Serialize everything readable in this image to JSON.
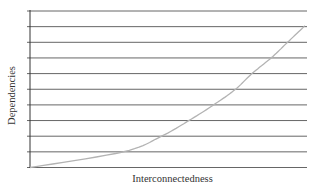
{
  "chart_data": {
    "type": "line",
    "title": "",
    "xlabel": "Interconnectedness",
    "ylabel": "Dependencies",
    "grid": true,
    "gridlines_count": 11,
    "legend": null,
    "x_ticks": [],
    "y_ticks": [],
    "xlim": [
      0,
      1
    ],
    "ylim": [
      0,
      10
    ],
    "series": [
      {
        "name": "Dependencies vs Interconnectedness",
        "color": "#b3b3b3",
        "x": [
          0.0,
          0.34,
          0.48,
          0.58,
          0.67,
          0.75,
          0.81,
          0.88,
          0.94,
          1.0
        ],
        "y": [
          0,
          1,
          2,
          3,
          4,
          5,
          6,
          7,
          8,
          9
        ]
      }
    ]
  },
  "axes": {
    "x_label": "Interconnectedness",
    "y_label": "Dependencies"
  },
  "colors": {
    "gridline": "#666666",
    "axis": "#333333",
    "curve": "#b3b3b3"
  }
}
